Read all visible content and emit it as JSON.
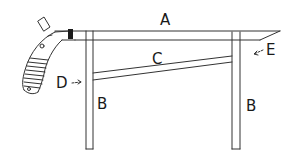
{
  "diagram": {
    "type": "furniture-part-sketch",
    "labels": {
      "A": "A",
      "B_left": "B",
      "B_right": "B",
      "C": "C",
      "D": "D",
      "E": "E"
    },
    "parts": [
      {
        "id": "A",
        "description": "top rail"
      },
      {
        "id": "B",
        "description": "legs (left and right)"
      },
      {
        "id": "C",
        "description": "diagonal brace"
      },
      {
        "id": "D",
        "description": "pointer to left leg / brace joint"
      },
      {
        "id": "E",
        "description": "pointer to right end of top rail"
      }
    ],
    "colors": {
      "ink": "#333333",
      "background": "#ffffff",
      "band": "#1a1a1a"
    }
  }
}
